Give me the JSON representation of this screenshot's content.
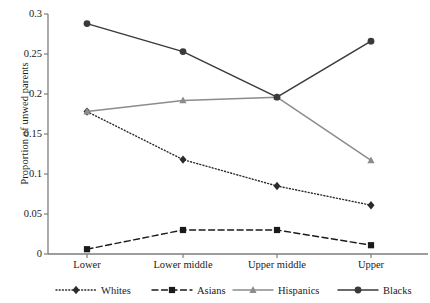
{
  "chart_data": {
    "type": "line",
    "title": "",
    "xlabel": "",
    "ylabel": "Proportion of unwed parents",
    "categories": [
      "Lower",
      "Lower middle",
      "Upper middle",
      "Upper"
    ],
    "ylim": [
      0,
      0.3
    ],
    "yticks": [
      0,
      0.05,
      0.1,
      0.15,
      0.2,
      0.25,
      0.3
    ],
    "ytick_labels": [
      "0",
      "0.05",
      "0.1",
      "0.15",
      "0.2",
      "0.25",
      "0.3"
    ],
    "grid": false,
    "legend_position": "bottom",
    "series": [
      {
        "name": "Whites",
        "values": [
          0.178,
          0.118,
          0.085,
          0.061
        ],
        "color": "#2b2b2b",
        "line_style": "dotted",
        "marker": "diamond"
      },
      {
        "name": "Asians",
        "values": [
          0.006,
          0.03,
          0.03,
          0.011
        ],
        "color": "#1a1a1a",
        "line_style": "dashed",
        "marker": "square"
      },
      {
        "name": "Hispanics",
        "values": [
          0.178,
          0.192,
          0.196,
          0.117
        ],
        "color": "#8c8c8c",
        "line_style": "solid",
        "marker": "triangle"
      },
      {
        "name": "Blacks",
        "values": [
          0.288,
          0.253,
          0.196,
          0.266
        ],
        "color": "#3a3a3a",
        "line_style": "solid",
        "marker": "circle"
      }
    ]
  },
  "axis": {
    "color": "#7d7d7d"
  }
}
